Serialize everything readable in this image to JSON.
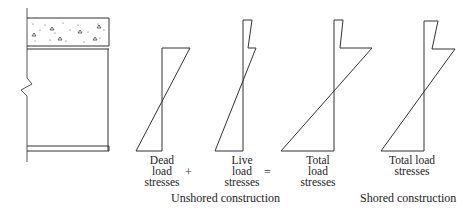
{
  "figure": {
    "section": {
      "slab": "concrete-slab",
      "beam": "steel-beam"
    },
    "diagrams": [
      {
        "id": "dead",
        "lines": [
          "Dead",
          "load",
          "stresses"
        ]
      },
      {
        "id": "live",
        "lines": [
          "Live",
          "load",
          "stresses"
        ]
      },
      {
        "id": "total-unshored",
        "lines": [
          "Total",
          "load",
          "stresses"
        ]
      },
      {
        "id": "total-shored",
        "lines": [
          "Total load",
          "stresses"
        ]
      }
    ],
    "operators": {
      "plus": "+",
      "equals": "="
    },
    "captions": {
      "unshored": "Unshored construction",
      "shored": "Shored construction"
    },
    "colors": {
      "line": "#333333",
      "background": "#ffffff"
    }
  }
}
